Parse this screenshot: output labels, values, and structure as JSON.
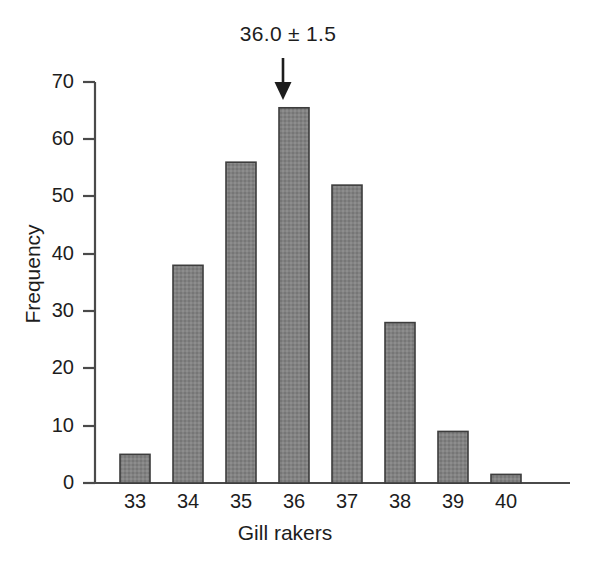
{
  "chart_data": {
    "type": "bar",
    "title": "",
    "subtitle": "",
    "xlabel": "Gill rakers",
    "ylabel": "Frequency",
    "categories": [
      "33",
      "34",
      "35",
      "36",
      "37",
      "38",
      "39",
      "40"
    ],
    "values": [
      5,
      38,
      56,
      65.5,
      52,
      28,
      9,
      1.5
    ],
    "series": [
      {
        "name": "Frequency",
        "values": [
          5,
          38,
          56,
          65.5,
          52,
          28,
          9,
          1.5
        ]
      }
    ],
    "xlim": [
      32.3,
      41.5
    ],
    "ylim": [
      0,
      70
    ],
    "yticks": [
      0,
      10,
      20,
      30,
      40,
      50,
      60,
      70
    ],
    "ytick_labels": [
      "0",
      "10",
      "20",
      "30",
      "40",
      "50",
      "60",
      "70"
    ],
    "xtick_labels": [
      "33",
      "34",
      "35",
      "36",
      "37",
      "38",
      "39",
      "40"
    ],
    "grid": false,
    "legend": false,
    "legend_position": "none",
    "annotations": [
      {
        "text": "36.0 ± 1.5",
        "points_to_category": "36",
        "marker": "down-arrow"
      }
    ],
    "bar_fill_color": "#808080",
    "bar_edge_color": "#3d3d3d",
    "axis_color": "#4a4a4a",
    "text_color": "#1d1d1d",
    "background_color": "#ffffff"
  },
  "axes": {
    "y_title": "Frequency",
    "x_title": "Gill rakers",
    "y_ticks": [
      "70",
      "60",
      "50",
      "40",
      "30",
      "20",
      "10",
      "0"
    ],
    "x_ticks": [
      "33",
      "34",
      "35",
      "36",
      "37",
      "38",
      "39",
      "40"
    ]
  },
  "annotation": {
    "label": "36.0 ± 1.5"
  }
}
